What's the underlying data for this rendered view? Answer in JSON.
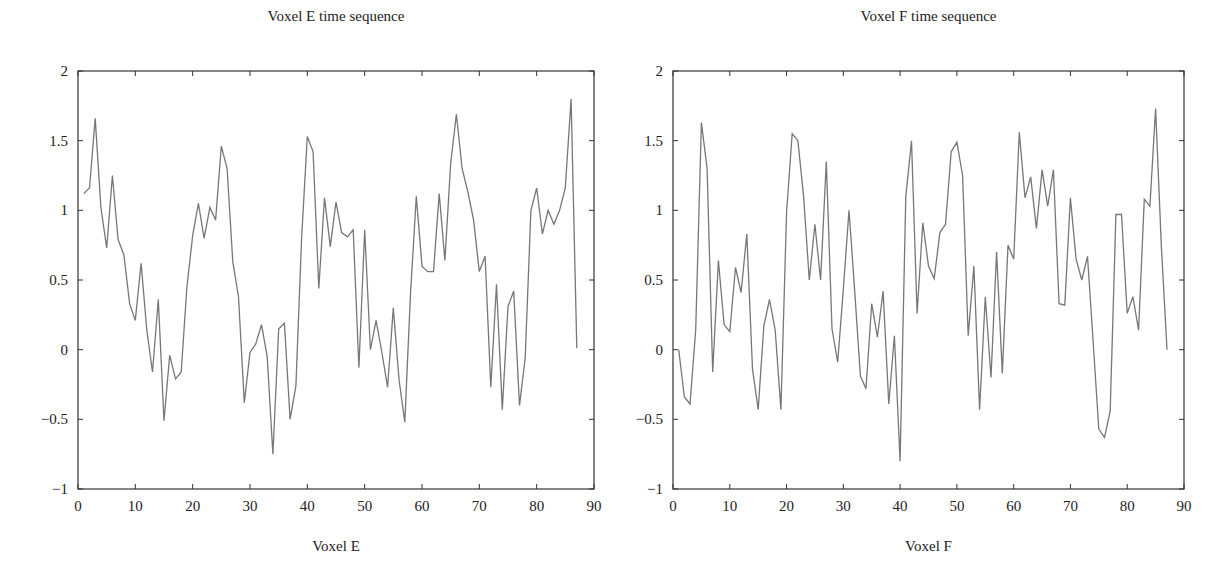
{
  "chart_data": [
    {
      "type": "line",
      "title": "Voxel E time sequence",
      "xlabel": "Voxel E",
      "ylabel": "",
      "xlim": [
        0,
        90
      ],
      "ylim": [
        -1,
        2
      ],
      "xticks": [
        0,
        10,
        20,
        30,
        40,
        50,
        60,
        70,
        80,
        90
      ],
      "yticks": [
        -1,
        -0.5,
        0,
        0.5,
        1,
        1.5,
        2
      ],
      "ytick_labels": [
        "−1",
        "−0.5",
        "0",
        "0.5",
        "1",
        "1.5",
        "2"
      ],
      "grid": false,
      "legend": null,
      "line_color": "#777777",
      "x": [
        1,
        2,
        3,
        4,
        5,
        6,
        7,
        8,
        9,
        10,
        11,
        12,
        13,
        14,
        15,
        16,
        17,
        18,
        19,
        20,
        21,
        22,
        23,
        24,
        25,
        26,
        27,
        28,
        29,
        30,
        31,
        32,
        33,
        34,
        35,
        36,
        37,
        38,
        39,
        40,
        41,
        42,
        43,
        44,
        45,
        46,
        47,
        48,
        49,
        50,
        51,
        52,
        53,
        54,
        55,
        56,
        57,
        58,
        59,
        60,
        61,
        62,
        63,
        64,
        65,
        66,
        67,
        68,
        69,
        70,
        71,
        72,
        73,
        74,
        75,
        76,
        77,
        78,
        79,
        80,
        81,
        82,
        83,
        84,
        85,
        86,
        87
      ],
      "values": [
        1.12,
        1.16,
        1.66,
        1.02,
        0.73,
        1.25,
        0.79,
        0.68,
        0.33,
        0.21,
        0.62,
        0.14,
        -0.16,
        0.36,
        -0.51,
        -0.04,
        -0.21,
        -0.16,
        0.45,
        0.82,
        1.05,
        0.8,
        1.02,
        0.93,
        1.46,
        1.3,
        0.63,
        0.38,
        -0.38,
        -0.02,
        0.04,
        0.18,
        -0.05,
        -0.75,
        0.15,
        0.19,
        -0.5,
        -0.26,
        0.8,
        1.53,
        1.42,
        0.44,
        1.09,
        0.74,
        1.06,
        0.84,
        0.81,
        0.86,
        -0.13,
        0.86,
        0.0,
        0.21,
        -0.02,
        -0.27,
        0.3,
        -0.22,
        -0.52,
        0.4,
        1.1,
        0.6,
        0.56,
        0.56,
        1.12,
        0.64,
        1.34,
        1.69,
        1.3,
        1.13,
        0.93,
        0.56,
        0.67,
        -0.27,
        0.47,
        -0.43,
        0.31,
        0.42,
        -0.4,
        -0.06,
        1.0,
        1.16,
        0.83,
        1.0,
        0.9,
        1.0,
        1.16,
        1.8,
        0.01
      ]
    },
    {
      "type": "line",
      "title": "Voxel F time sequence",
      "xlabel": "Voxel F",
      "ylabel": "",
      "xlim": [
        0,
        90
      ],
      "ylim": [
        -1,
        2
      ],
      "xticks": [
        0,
        10,
        20,
        30,
        40,
        50,
        60,
        70,
        80,
        90
      ],
      "yticks": [
        -1,
        -0.5,
        0,
        0.5,
        1,
        1.5,
        2
      ],
      "ytick_labels": [
        "−1",
        "−0.5",
        "0",
        "0.5",
        "1",
        "1.5",
        "2"
      ],
      "grid": false,
      "legend": null,
      "line_color": "#777777",
      "x": [
        1,
        2,
        3,
        4,
        5,
        6,
        7,
        8,
        9,
        10,
        11,
        12,
        13,
        14,
        15,
        16,
        17,
        18,
        19,
        20,
        21,
        22,
        23,
        24,
        25,
        26,
        27,
        28,
        29,
        30,
        31,
        32,
        33,
        34,
        35,
        36,
        37,
        38,
        39,
        40,
        41,
        42,
        43,
        44,
        45,
        46,
        47,
        48,
        49,
        50,
        51,
        52,
        53,
        54,
        55,
        56,
        57,
        58,
        59,
        60,
        61,
        62,
        63,
        64,
        65,
        66,
        67,
        68,
        69,
        70,
        71,
        72,
        73,
        74,
        75,
        76,
        77,
        78,
        79,
        80,
        81,
        82,
        83,
        84,
        85,
        86,
        87
      ],
      "values": [
        0.0,
        -0.34,
        -0.39,
        0.14,
        1.63,
        1.3,
        -0.16,
        0.64,
        0.18,
        0.13,
        0.59,
        0.41,
        0.83,
        -0.14,
        -0.43,
        0.17,
        0.36,
        0.14,
        -0.43,
        0.99,
        1.55,
        1.5,
        1.1,
        0.5,
        0.9,
        0.5,
        1.35,
        0.15,
        -0.09,
        0.43,
        1.0,
        0.42,
        -0.19,
        -0.28,
        0.33,
        0.09,
        0.42,
        -0.39,
        0.1,
        -0.8,
        1.1,
        1.5,
        0.26,
        0.91,
        0.6,
        0.51,
        0.84,
        0.9,
        1.42,
        1.49,
        1.25,
        0.1,
        0.6,
        -0.43,
        0.38,
        -0.2,
        0.7,
        -0.17,
        0.75,
        0.65,
        1.56,
        1.09,
        1.24,
        0.87,
        1.29,
        1.03,
        1.29,
        0.33,
        0.32,
        1.09,
        0.65,
        0.5,
        0.67,
        0.05,
        -0.57,
        -0.63,
        -0.44,
        0.97,
        0.97,
        0.26,
        0.38,
        0.14,
        1.08,
        1.03,
        1.73,
        0.75,
        0.0
      ]
    }
  ],
  "panels": [
    {
      "title": "Voxel E time sequence",
      "xlabel": "Voxel E"
    },
    {
      "title": "Voxel F time sequence",
      "xlabel": "Voxel F"
    }
  ]
}
